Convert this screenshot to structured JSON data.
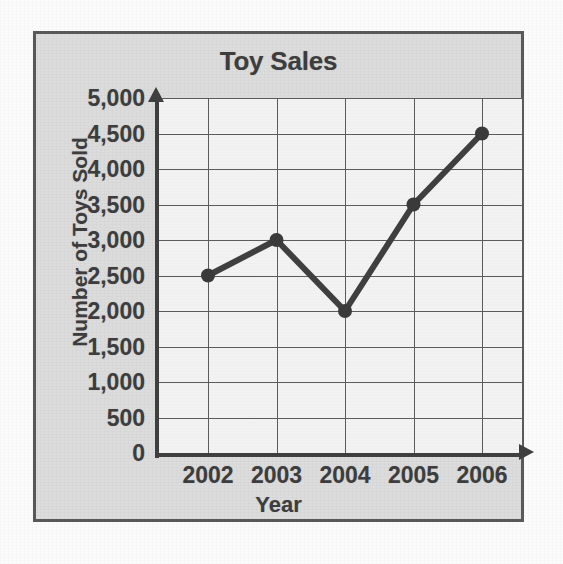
{
  "chart_data": {
    "type": "line",
    "title": "Toy Sales",
    "xlabel": "Year",
    "ylabel": "Number of Toys Sold",
    "categories": [
      "2002",
      "2003",
      "2004",
      "2005",
      "2006"
    ],
    "values": [
      2500,
      3000,
      2000,
      3500,
      4500
    ],
    "series": [
      {
        "name": "Number of Toys Sold",
        "values": [
          2500,
          3000,
          2000,
          3500,
          4500
        ]
      }
    ],
    "x_tick_labels": [
      "2002",
      "2003",
      "2004",
      "2005",
      "2006"
    ],
    "y_tick_labels": [
      "5,000",
      "4,500",
      "4,000",
      "3,500",
      "3,000",
      "2,500",
      "2,000",
      "1,500",
      "1,000",
      "500",
      "0"
    ],
    "y_tick_values": [
      5000,
      4500,
      4000,
      3500,
      3000,
      2500,
      2000,
      1500,
      1000,
      500,
      0
    ],
    "ylim": [
      0,
      5000
    ],
    "y_tick_step": 500,
    "grid": "both",
    "legend": "none",
    "marker": "filled-circle",
    "line_color": "#3f3f3f",
    "marker_color": "#3a3a3a",
    "grid_color": "#5b5b5b",
    "axis_color": "#3f3f3f",
    "text_color": "#3d3d3d",
    "plot_background": "#f2f2f2",
    "panel_background": "#dcdcdc",
    "panel_border_color": "#595959",
    "x_axis_arrow": "arrow-right",
    "y_axis_arrow": "arrow-up",
    "data_points": [
      {
        "x": "2002",
        "y": 2500
      },
      {
        "x": "2003",
        "y": 3000
      },
      {
        "x": "2004",
        "y": 2000
      },
      {
        "x": "2005",
        "y": 3500
      },
      {
        "x": "2006",
        "y": 4500
      }
    ]
  }
}
